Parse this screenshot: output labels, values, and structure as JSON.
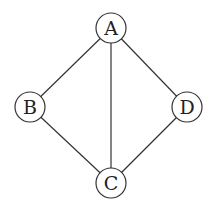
{
  "diagram": {
    "type": "undirected-graph",
    "nodes": [
      {
        "id": "A",
        "label": "A",
        "x": 111,
        "y": 28
      },
      {
        "id": "B",
        "label": "B",
        "x": 30,
        "y": 107
      },
      {
        "id": "C",
        "label": "C",
        "x": 111,
        "y": 183
      },
      {
        "id": "D",
        "label": "D",
        "x": 187,
        "y": 107
      }
    ],
    "edges": [
      {
        "from": "A",
        "to": "B"
      },
      {
        "from": "A",
        "to": "C"
      },
      {
        "from": "A",
        "to": "D"
      },
      {
        "from": "B",
        "to": "C"
      },
      {
        "from": "D",
        "to": "C"
      }
    ],
    "node_radius": 15
  },
  "cropped_top_text": "▔ ▔▔ ▔  ▔ ▔   ▔ ▔ ▔"
}
